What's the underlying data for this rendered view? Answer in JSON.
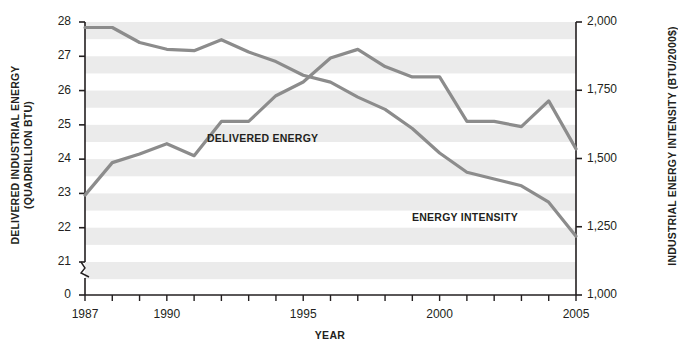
{
  "chart_data": {
    "type": "line",
    "title": "",
    "xlabel": "YEAR",
    "x": [
      1987,
      1988,
      1989,
      1990,
      1991,
      1992,
      1993,
      1994,
      1995,
      1996,
      1997,
      1998,
      1999,
      2000,
      2001,
      2002,
      2003,
      2004,
      2005
    ],
    "axes": {
      "left": {
        "label_line1": "DELIVERED INDUSTRIAL ENERGY",
        "label_line2": "(QUADRILLION BTU)",
        "ticks": [
          "28",
          "27",
          "26",
          "25",
          "24",
          "23",
          "22",
          "21",
          "0"
        ],
        "tick_values": [
          28,
          27,
          26,
          25,
          24,
          23,
          22,
          21,
          0
        ],
        "ylim": [
          21,
          28
        ],
        "axis_break": true
      },
      "right": {
        "label": "INDUSTRIAL ENERGY INTENSITY (BTU/2000$)",
        "ticks": [
          "2,000",
          "1,750",
          "1,500",
          "1,250",
          "1,000"
        ],
        "tick_values": [
          2000,
          1750,
          1500,
          1250,
          1000
        ],
        "ylim": [
          1000,
          2000
        ]
      },
      "x": {
        "ticks_labeled": [
          "1987",
          "1990",
          "1995",
          "2000",
          "2005"
        ],
        "tick_values_labeled": [
          1987,
          1990,
          1995,
          2000,
          2005
        ],
        "xlim": [
          1987,
          2005
        ],
        "minor_tick_interval": 1
      }
    },
    "grid": "horizontal-alternating-bands",
    "legend": "inline-labels",
    "series": [
      {
        "name": "DELIVERED ENERGY",
        "axis": "left",
        "unit": "quadrillion BTU",
        "color": "#8c8c8c",
        "values": [
          22.95,
          23.9,
          24.15,
          24.45,
          24.1,
          25.1,
          25.1,
          25.85,
          26.25,
          26.95,
          27.2,
          26.7,
          26.4,
          26.4,
          25.1,
          25.1,
          24.95,
          25.7,
          24.3
        ]
      },
      {
        "name": "ENERGY INTENSITY",
        "axis": "right",
        "unit": "BTU/2000$",
        "color": "#8c8c8c",
        "values": [
          1980,
          1980,
          1925,
          1900,
          1895,
          1935,
          1890,
          1855,
          1805,
          1780,
          1725,
          1680,
          1610,
          1520,
          1450,
          1425,
          1400,
          1340,
          1215
        ]
      }
    ],
    "annotations": [
      {
        "text": "DELIVERED ENERGY",
        "series": "DELIVERED ENERGY"
      },
      {
        "text": "ENERGY INTENSITY",
        "series": "ENERGY INTENSITY"
      }
    ]
  },
  "colors": {
    "line": "#8c8c8c",
    "band": "#ebebeb",
    "axis": "#231f20",
    "text": "#231f20"
  }
}
